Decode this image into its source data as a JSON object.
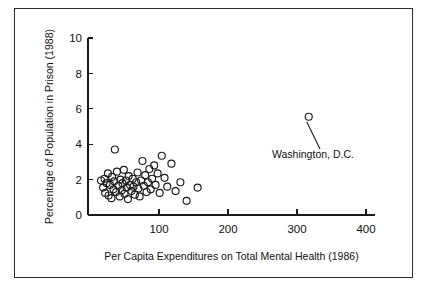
{
  "figure": {
    "background_color": "#ffffff",
    "frame_color": "#2b2b2b",
    "marker_color": "#1a1a1a"
  },
  "chart_data": {
    "type": "scatter",
    "title": "",
    "xlabel": "Per Capita Expenditures on Total Mental Health (1986)",
    "ylabel": "Percentage of Population in Prison (1988)",
    "xlim": [
      0,
      410
    ],
    "ylim": [
      0,
      10.3
    ],
    "xticks": [
      100,
      200,
      300,
      400
    ],
    "xtick_labels": [
      "100",
      "200",
      "300",
      "400"
    ],
    "yticks": [
      0,
      2,
      4,
      6,
      8,
      10
    ],
    "ytick_labels": [
      "0",
      "2",
      "4",
      "6",
      "8",
      "10"
    ],
    "grid": false,
    "legend": null,
    "marker_style": "open-circle",
    "annotations": [
      {
        "label": "Washington, D.C.",
        "point_x": 317,
        "point_y": 5.55,
        "text_x": 272,
        "text_y": 158
      }
    ],
    "points": [
      {
        "x": 16,
        "y": 1.95
      },
      {
        "x": 19,
        "y": 1.55
      },
      {
        "x": 21,
        "y": 2.05
      },
      {
        "x": 22,
        "y": 1.25
      },
      {
        "x": 24,
        "y": 1.8
      },
      {
        "x": 26,
        "y": 2.35
      },
      {
        "x": 27,
        "y": 1.1
      },
      {
        "x": 29,
        "y": 1.7
      },
      {
        "x": 31,
        "y": 0.95
      },
      {
        "x": 32,
        "y": 2.15
      },
      {
        "x": 34,
        "y": 1.45
      },
      {
        "x": 35,
        "y": 1.9
      },
      {
        "x": 36,
        "y": 3.7
      },
      {
        "x": 38,
        "y": 1.3
      },
      {
        "x": 39,
        "y": 2.45
      },
      {
        "x": 41,
        "y": 1.65
      },
      {
        "x": 43,
        "y": 1.05
      },
      {
        "x": 44,
        "y": 2.0
      },
      {
        "x": 46,
        "y": 1.4
      },
      {
        "x": 47,
        "y": 1.8
      },
      {
        "x": 49,
        "y": 2.55
      },
      {
        "x": 50,
        "y": 1.2
      },
      {
        "x": 52,
        "y": 1.95
      },
      {
        "x": 53,
        "y": 1.55
      },
      {
        "x": 55,
        "y": 0.9
      },
      {
        "x": 56,
        "y": 2.2
      },
      {
        "x": 58,
        "y": 1.7
      },
      {
        "x": 60,
        "y": 1.35
      },
      {
        "x": 62,
        "y": 2.05
      },
      {
        "x": 63,
        "y": 1.6
      },
      {
        "x": 65,
        "y": 1.15
      },
      {
        "x": 67,
        "y": 1.85
      },
      {
        "x": 69,
        "y": 2.4
      },
      {
        "x": 70,
        "y": 1.5
      },
      {
        "x": 72,
        "y": 1.05
      },
      {
        "x": 74,
        "y": 1.95
      },
      {
        "x": 76,
        "y": 3.05
      },
      {
        "x": 78,
        "y": 1.65
      },
      {
        "x": 80,
        "y": 2.25
      },
      {
        "x": 82,
        "y": 1.3
      },
      {
        "x": 84,
        "y": 1.85
      },
      {
        "x": 86,
        "y": 2.6
      },
      {
        "x": 88,
        "y": 1.45
      },
      {
        "x": 90,
        "y": 2.05
      },
      {
        "x": 93,
        "y": 2.8
      },
      {
        "x": 95,
        "y": 1.7
      },
      {
        "x": 98,
        "y": 2.35
      },
      {
        "x": 101,
        "y": 1.25
      },
      {
        "x": 104,
        "y": 3.35
      },
      {
        "x": 108,
        "y": 2.1
      },
      {
        "x": 112,
        "y": 1.6
      },
      {
        "x": 118,
        "y": 2.9
      },
      {
        "x": 124,
        "y": 1.35
      },
      {
        "x": 131,
        "y": 1.85
      },
      {
        "x": 140,
        "y": 0.8
      },
      {
        "x": 156,
        "y": 1.55
      }
    ]
  }
}
